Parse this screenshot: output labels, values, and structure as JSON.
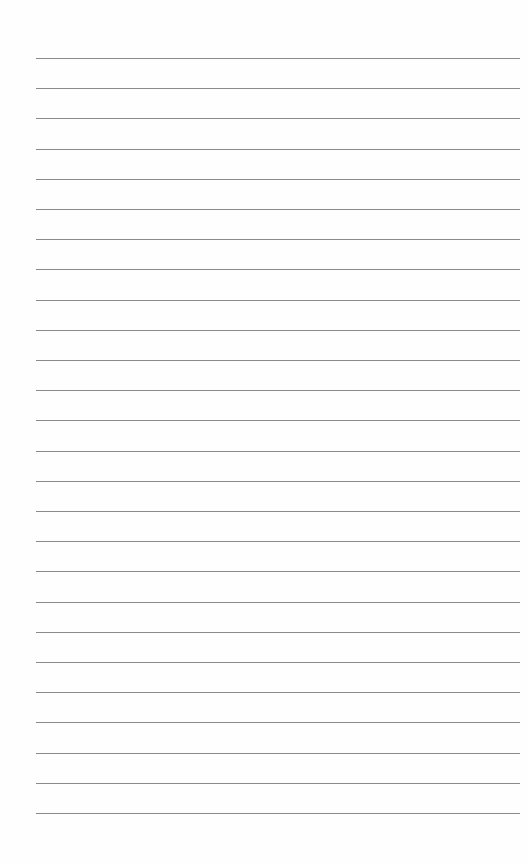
{
  "page": {
    "type": "lined-paper",
    "background_color": "#fefefe",
    "line_color": "#8a8a8a",
    "line_count": 26,
    "first_line_y": 58,
    "line_spacing": 30.2,
    "line_left": 36,
    "line_width": 484
  }
}
